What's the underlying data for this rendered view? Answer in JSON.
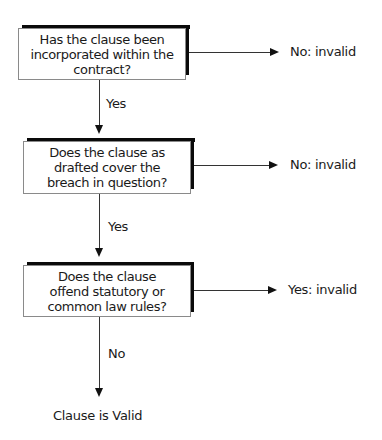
{
  "flowchart": {
    "decisions": [
      {
        "question": "Has the clause been\nincorporated within the\ncontract?",
        "down_label": "Yes",
        "right_label": "No: invalid"
      },
      {
        "question": "Does the clause as\ndrafted cover the\nbreach in question?",
        "down_label": "Yes",
        "right_label": "No: invalid"
      },
      {
        "question": "Does the clause\noffend statutory or\ncommon law rules?",
        "down_label": "No",
        "right_label": "Yes: invalid"
      }
    ],
    "outcome": "Clause is Valid"
  },
  "colors": {
    "box_border": "#8a8a8a",
    "shadow": "#0a0a0a",
    "arrow": "#333333",
    "text": "#1a1a1a"
  }
}
